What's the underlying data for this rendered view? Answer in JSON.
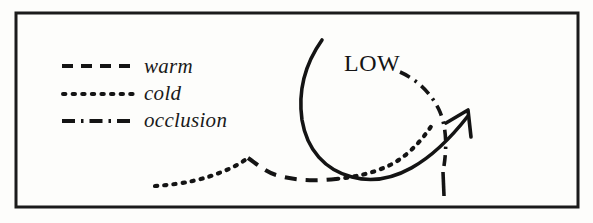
{
  "figure": {
    "background_color": "#fdfdfb",
    "ink_color": "#141414",
    "frame": {
      "name": "border-frame",
      "x": 16,
      "y": 13,
      "width": 562,
      "height": 194,
      "stroke_width": 3
    }
  },
  "legend": {
    "items": [
      {
        "key": "warm",
        "label": "warm",
        "style": "dashed",
        "sample_icon": "dashed-line-icon",
        "dash_pattern": "11 8",
        "sample_x1": 62,
        "sample_x2": 134,
        "sample_y": 66
      },
      {
        "key": "cold",
        "label": "cold",
        "style": "dotted",
        "sample_icon": "dotted-line-icon",
        "dash_pattern": "2.4 7.2",
        "sample_x1": 62,
        "sample_x2": 134,
        "sample_y": 94
      },
      {
        "key": "occlusion",
        "label": "occlusion",
        "style": "dash-dot",
        "sample_icon": "dash-dot-line-icon",
        "dash_pattern": "13 6 2.5 6",
        "sample_x1": 62,
        "sample_x2": 136,
        "sample_y": 121
      }
    ]
  },
  "map": {
    "low_center_label": "LOW",
    "fronts": [
      {
        "name": "cold-front-west",
        "style": "dotted",
        "path": "M 155 186 C 185 184 205 179 224 171 C 234 167 241 163 248 158"
      },
      {
        "name": "warm-front-trailing",
        "style": "dashed",
        "path": "M 248 158 C 258 165 266 172 276 175 C 296 181 316 181 336 179"
      },
      {
        "name": "cold-front-east",
        "style": "dotted",
        "path": "M 336 179 C 356 177 372 173 386 167 C 404 159 420 144 434 122"
      },
      {
        "name": "occlusion-front",
        "style": "dash-dot",
        "path": "M 400 72 C 418 80 432 94 440 112 C 447 129 447 150 443 172"
      },
      {
        "name": "occlusion-front-tail",
        "style": "dash-dot",
        "path": "M 443 172 L 444 196"
      }
    ],
    "airflow": {
      "name": "airflow-arrow",
      "style": "solid",
      "path": "M 322 40 C 305 64 298 92 302 120 C 307 150 325 170 352 177 C 392 188 432 162 468 116",
      "arrowhead": "M 468 116 L 447 122 M 468 116 L 470 138"
    }
  }
}
